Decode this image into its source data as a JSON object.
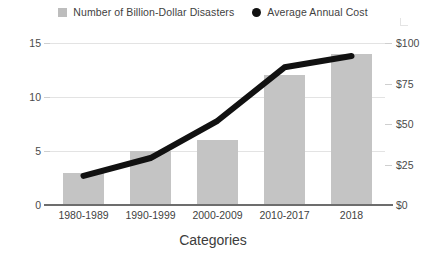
{
  "chart_data": {
    "type": "bar",
    "title": "",
    "xlabel": "Categories",
    "ylabel": "",
    "categories": [
      "1980-1989",
      "1990-1999",
      "2000-2009",
      "2010-2017",
      "2018"
    ],
    "series": [
      {
        "name": "Number of Billion-Dollar Disasters",
        "type": "bar",
        "axis": "left",
        "color": "#c4c4c4",
        "marker": "square",
        "values": [
          3,
          5,
          6,
          12,
          14
        ]
      },
      {
        "name": "Average Annual Cost",
        "type": "line",
        "axis": "right",
        "color": "#111111",
        "marker": "circle",
        "values": [
          18,
          29,
          52,
          85,
          92
        ]
      }
    ],
    "left_axis": {
      "ticks": [
        "0",
        "5",
        "10",
        "15"
      ],
      "tick_values": [
        0,
        5,
        10,
        15
      ],
      "ylim": [
        0,
        15
      ]
    },
    "right_axis": {
      "ticks": [
        "$0",
        "$25",
        "$50",
        "$75",
        "$100"
      ],
      "tick_values": [
        0,
        25,
        50,
        75,
        100
      ],
      "ylim": [
        0,
        100
      ]
    },
    "grid": true,
    "legend_position": "top-center"
  },
  "legend": {
    "items": [
      {
        "label": "Number of Billion-Dollar Disasters",
        "marker": "square-swatch",
        "color": "#bdbdbd"
      },
      {
        "label": "Average Annual Cost",
        "marker": "dot-swatch",
        "color": "#111111"
      }
    ]
  },
  "axis_title": "Categories",
  "colors": {
    "bar": "#c4c4c4",
    "line": "#111111",
    "grid": "#e3e3e3",
    "axis": "#6d6d6d",
    "text": "#3c3c3c",
    "background": "#ffffff"
  }
}
